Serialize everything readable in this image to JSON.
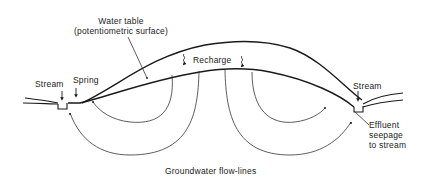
{
  "labels": {
    "water_table_line1": "Water table",
    "water_table_line2": "(potentiometric surface)",
    "recharge": "Recharge",
    "stream_left": "Stream",
    "spring": "Spring",
    "stream_right": "Stream",
    "effluent_line1": "Effluent",
    "effluent_line2": "seepage",
    "effluent_line3": "to stream",
    "flowlines": "Groundwater flow-lines"
  },
  "colors": {
    "line": "#1a1a1a",
    "thin_line": "#333333",
    "text": "#222222",
    "background": "#ffffff"
  }
}
